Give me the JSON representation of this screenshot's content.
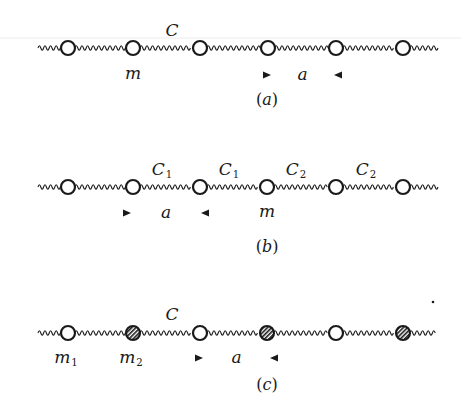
{
  "figure": {
    "colors": {
      "ink": "#1a1a1a",
      "background": "#ffffff",
      "faint_rule": "#e4e4e4"
    },
    "panels": [
      {
        "id": "a",
        "caption": "(a)",
        "line_y": 48,
        "line_x_start": 38,
        "line_x_end": 440,
        "masses": [
          {
            "x": 68,
            "type": "open"
          },
          {
            "x": 133,
            "type": "open"
          },
          {
            "x": 200,
            "type": "open"
          },
          {
            "x": 268,
            "type": "open"
          },
          {
            "x": 336,
            "type": "open"
          },
          {
            "x": 403,
            "type": "open"
          }
        ],
        "spring_labels": [
          {
            "text": "C",
            "sub": "",
            "x": 172,
            "y": 36
          }
        ],
        "mass_labels": [
          {
            "text": "m",
            "sub": "",
            "x": 133,
            "y": 79
          }
        ],
        "spacing": {
          "text": "a",
          "x_left": 266,
          "x_right": 339,
          "y": 75
        },
        "caption_pos": {
          "x": 267,
          "y": 105
        }
      },
      {
        "id": "b",
        "caption": "(b)",
        "line_y": 187,
        "line_x_start": 38,
        "line_x_end": 440,
        "masses": [
          {
            "x": 68,
            "type": "open"
          },
          {
            "x": 133,
            "type": "open"
          },
          {
            "x": 200,
            "type": "open"
          },
          {
            "x": 267,
            "type": "open"
          },
          {
            "x": 336,
            "type": "open"
          },
          {
            "x": 403,
            "type": "open"
          }
        ],
        "spring_labels": [
          {
            "text": "C",
            "sub": "1",
            "x": 162,
            "y": 175
          },
          {
            "text": "C",
            "sub": "1",
            "x": 229,
            "y": 175
          },
          {
            "text": "C",
            "sub": "2",
            "x": 296,
            "y": 175
          },
          {
            "text": "C",
            "sub": "2",
            "x": 366,
            "y": 175
          }
        ],
        "mass_labels": [
          {
            "text": "m",
            "sub": "",
            "x": 267,
            "y": 217
          }
        ],
        "spacing": {
          "text": "a",
          "x_left": 126,
          "x_right": 206,
          "y": 213
        },
        "caption_pos": {
          "x": 267,
          "y": 252
        }
      },
      {
        "id": "c",
        "caption": "(c)",
        "line_y": 333,
        "line_x_start": 38,
        "line_x_end": 436,
        "masses": [
          {
            "x": 68,
            "type": "open"
          },
          {
            "x": 133,
            "type": "hatched"
          },
          {
            "x": 200,
            "type": "open"
          },
          {
            "x": 267,
            "type": "hatched"
          },
          {
            "x": 336,
            "type": "open"
          },
          {
            "x": 403,
            "type": "hatched"
          }
        ],
        "spring_labels": [
          {
            "text": "C",
            "sub": "",
            "x": 172,
            "y": 320
          }
        ],
        "mass_labels": [
          {
            "text": "m",
            "sub": "1",
            "x": 66,
            "y": 363
          },
          {
            "text": "m",
            "sub": "2",
            "x": 131,
            "y": 363
          }
        ],
        "spacing": {
          "text": "a",
          "x_left": 198,
          "x_right": 275,
          "y": 358
        },
        "caption_pos": {
          "x": 267,
          "y": 390
        }
      }
    ],
    "stray_mark": {
      "x": 433,
      "y": 302
    }
  }
}
